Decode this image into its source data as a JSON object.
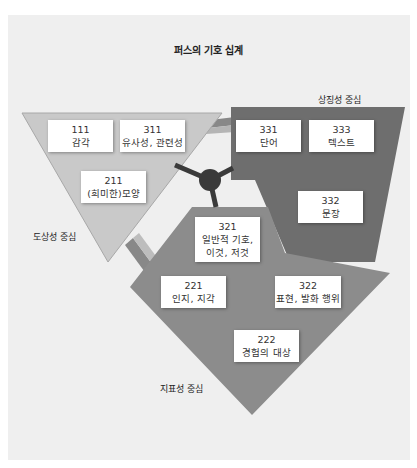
{
  "title": "퍼스의 기호 십계",
  "regions": {
    "iconic": {
      "label": "도상성 중심",
      "color": "#c9c9c9"
    },
    "symbolic": {
      "label": "상징성 중심",
      "color": "#6e6e6e"
    },
    "indexical": {
      "label": "지표성 중심",
      "color": "#8c8c8c"
    }
  },
  "hub_color": "#3a3a3a",
  "boxes": [
    {
      "code": "111",
      "text": "감각"
    },
    {
      "code": "311",
      "text": "유사성, 관련성"
    },
    {
      "code": "211",
      "text": "(희미한)모양"
    },
    {
      "code": "331",
      "text": "단어"
    },
    {
      "code": "333",
      "text": "텍스트"
    },
    {
      "code": "332",
      "text": "문장"
    },
    {
      "code": "321",
      "text": "일반적 기호,",
      "text2": "이것, 저것"
    },
    {
      "code": "221",
      "text": "인지, 지각"
    },
    {
      "code": "322",
      "text": "표현, 발화 행위"
    },
    {
      "code": "222",
      "text": "경험의 대상"
    }
  ]
}
